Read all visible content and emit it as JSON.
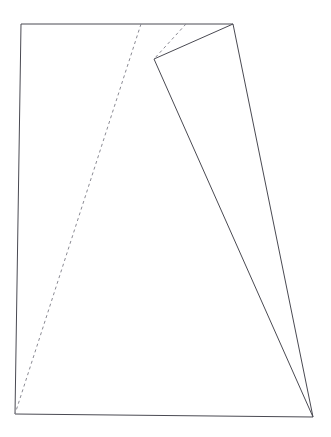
{
  "figure": {
    "canvas": {
      "width": 331,
      "height": 437,
      "background_color": "#ffffff"
    },
    "style": {
      "solid_stroke_color": "#4a4a52",
      "dashed_stroke_color": "#8a8a93",
      "solid_stroke_width": 1,
      "dashed_stroke_width": 1,
      "dash_pattern": "3,3"
    },
    "points": {
      "top_left": {
        "label": "A",
        "x": 21,
        "y": 24
      },
      "top_right": {
        "label": "B",
        "x": 233,
        "y": 24
      },
      "bottom_right": {
        "label": "C",
        "x": 313,
        "y": 417
      },
      "bottom_left": {
        "label": "D",
        "x": 15,
        "y": 414
      },
      "fold_apex": {
        "label": "E",
        "x": 154,
        "y": 59
      },
      "crease_top_left": {
        "label": "F",
        "x": 141,
        "y": 24
      },
      "crease_top_right": {
        "label": "G",
        "x": 186,
        "y": 24
      }
    },
    "shapes": [
      {
        "name": "outer-sheet-quadrilateral",
        "kind": "polygon",
        "style": "solid",
        "vertices": [
          [
            21,
            24
          ],
          [
            233,
            24
          ],
          [
            313,
            417
          ],
          [
            15,
            414
          ]
        ]
      },
      {
        "name": "folded-flap-edge-upper",
        "kind": "polyline",
        "style": "solid",
        "vertices": [
          [
            154,
            59
          ],
          [
            233,
            24
          ]
        ]
      },
      {
        "name": "folded-flap-edge-lower",
        "kind": "polyline",
        "style": "solid",
        "vertices": [
          [
            154,
            59
          ],
          [
            313,
            417
          ]
        ]
      },
      {
        "name": "crease-line-short",
        "kind": "polyline",
        "style": "dashed",
        "vertices": [
          [
            186,
            24
          ],
          [
            154,
            59
          ]
        ]
      },
      {
        "name": "crease-line-long",
        "kind": "polyline",
        "style": "dashed",
        "vertices": [
          [
            141,
            24
          ],
          [
            15,
            414
          ]
        ]
      }
    ]
  }
}
